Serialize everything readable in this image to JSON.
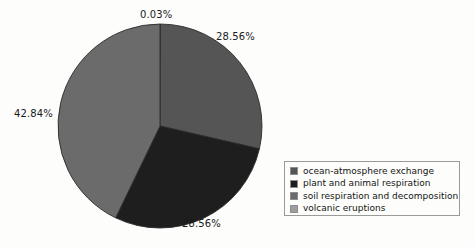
{
  "chart_data": {
    "type": "pie",
    "title": "",
    "categories": [
      "ocean-atmosphere exchange",
      "plant and animal respiration",
      "soil respiration and decomposition",
      "volcanic eruptions"
    ],
    "values": [
      28.56,
      28.56,
      42.84,
      0.03
    ],
    "value_labels": [
      "28.56%",
      "28.56%",
      "42.84%",
      "0.03%"
    ],
    "units": "percent",
    "total": 99.99,
    "start_angle_deg": 0,
    "direction": "clockwise",
    "colors": [
      "#555555",
      "#1e1e1e",
      "#6b6b6b",
      "#9e9e9e"
    ],
    "legend_position": "bottom-right",
    "grid": false,
    "slices": [
      {
        "label": "volcanic eruptions",
        "value": 0.03,
        "value_label": "0.03%",
        "color": "#9e9e9e",
        "label_position": "top"
      },
      {
        "label": "ocean-atmosphere exchange",
        "value": 28.56,
        "value_label": "28.56%",
        "color": "#555555",
        "label_position": "upper-right"
      },
      {
        "label": "plant and animal respiration",
        "value": 28.56,
        "value_label": "28.56%",
        "color": "#1e1e1e",
        "label_position": "bottom"
      },
      {
        "label": "soil respiration and decomposition",
        "value": 42.84,
        "value_label": "42.84%",
        "color": "#6b6b6b",
        "label_position": "left"
      }
    ]
  },
  "labels": {
    "volcanic": "0.03%",
    "ocean": "28.56%",
    "plant": "28.56%",
    "soil": "42.84%"
  },
  "legend": {
    "items": [
      {
        "label": "ocean-atmosphere exchange",
        "color": "#555555"
      },
      {
        "label": "plant and animal respiration",
        "color": "#1e1e1e"
      },
      {
        "label": "soil respiration and decomposition",
        "color": "#6b6b6b"
      },
      {
        "label": "volcanic eruptions",
        "color": "#9e9e9e"
      }
    ]
  }
}
